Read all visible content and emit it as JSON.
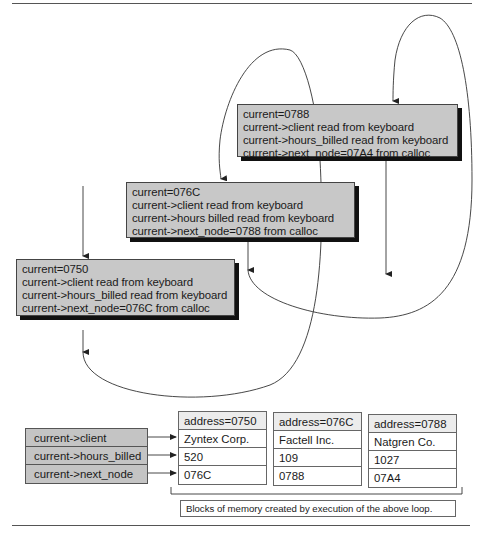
{
  "diagram": {
    "loop_states": [
      {
        "id": "iteration-1",
        "lines": [
          "current=0750",
          "current->client read from keyboard",
          "current->hours_billed read from keyboard",
          "current->next_node=076C from calloc"
        ]
      },
      {
        "id": "iteration-2",
        "lines": [
          "current=076C",
          "current->client read from keyboard",
          "current->hours billed read from keyboard",
          "current->next_node=0788 from calloc"
        ]
      },
      {
        "id": "iteration-3",
        "lines": [
          "current=0788",
          "current->client read from keyboard",
          "current->hours_billed read from keyboard",
          "current->next_node=07A4 from calloc"
        ]
      }
    ],
    "field_labels": [
      "current->client",
      "current->hours_billed",
      "current->next_node"
    ],
    "memory_blocks": [
      {
        "address": "address=0750",
        "client": "Zyntex Corp.",
        "hours_billed": "520",
        "next_node": "076C"
      },
      {
        "address": "address=076C",
        "client": "Factell Inc.",
        "hours_billed": "109",
        "next_node": "0788"
      },
      {
        "address": "address=0788",
        "client": "Natgren Co.",
        "hours_billed": "1027",
        "next_node": "07A4"
      }
    ],
    "caption": "Blocks of memory created by execution of the above loop.",
    "colors": {
      "box_fill": "#c8c8c8",
      "box_shadow": "#111111",
      "line": "#333333",
      "label_fill": "#c4c4c4",
      "address_fill": "#ececec"
    }
  }
}
